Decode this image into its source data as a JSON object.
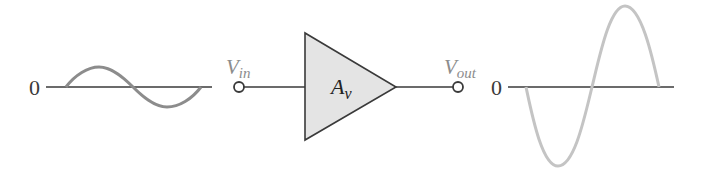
{
  "diagram": {
    "type": "amplifier-block-diagram",
    "input_waveform": {
      "zero_label": "0",
      "color": "#8c8c8c",
      "axis_color": "#3a3a3a",
      "start_phase": "positive"
    },
    "input_terminal": {
      "label_main": "V",
      "label_sub": "in",
      "label_color": "#8c8c8c"
    },
    "amplifier": {
      "label_main": "A",
      "label_sub": "v",
      "fill_color": "#e4e4e4",
      "stroke_color": "#3a3a3a"
    },
    "output_terminal": {
      "label_main": "V",
      "label_sub": "out",
      "label_color": "#8c8c8c"
    },
    "output_waveform": {
      "zero_label": "0",
      "color": "#c4c4c4",
      "axis_color": "#3a3a3a",
      "start_phase": "negative"
    }
  }
}
